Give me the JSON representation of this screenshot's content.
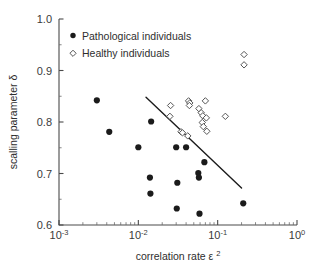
{
  "chart_data": {
    "type": "scatter",
    "title": "",
    "xlabel": "correlation rate ε²",
    "ylabel": "scalling parameter δ",
    "xscale": "log",
    "yscale": "linear",
    "xlim": [
      0.001,
      1.0
    ],
    "ylim": [
      0.6,
      1.0
    ],
    "grid": false,
    "legend_position": "top-left-inside",
    "x_tick_labels": [
      "10⁻³",
      "10⁻²",
      "10⁻¹",
      "10⁰"
    ],
    "x_tick_values": [
      0.001,
      0.01,
      0.1,
      1.0
    ],
    "x_tick_mantissa": [
      "10",
      "10",
      "10",
      "10"
    ],
    "x_tick_exponent": [
      "-3",
      "-2",
      "-1",
      "0"
    ],
    "y_tick_labels": [
      "1.0",
      "0.9",
      "0.8",
      "0.7",
      "0.6"
    ],
    "y_tick_values": [
      1.0,
      0.9,
      0.8,
      0.7,
      0.6
    ],
    "series": [
      {
        "name": "Pathological individuals",
        "marker": "filled-circle",
        "color": "#1b1b1b",
        "points": [
          {
            "x": 0.003,
            "y": 0.842
          },
          {
            "x": 0.0043,
            "y": 0.781
          },
          {
            "x": 0.01,
            "y": 0.751
          },
          {
            "x": 0.0145,
            "y": 0.801
          },
          {
            "x": 0.014,
            "y": 0.692
          },
          {
            "x": 0.0142,
            "y": 0.661
          },
          {
            "x": 0.03,
            "y": 0.751
          },
          {
            "x": 0.031,
            "y": 0.682
          },
          {
            "x": 0.0305,
            "y": 0.632
          },
          {
            "x": 0.04,
            "y": 0.751
          },
          {
            "x": 0.057,
            "y": 0.701
          },
          {
            "x": 0.058,
            "y": 0.692
          },
          {
            "x": 0.059,
            "y": 0.622
          },
          {
            "x": 0.068,
            "y": 0.722
          },
          {
            "x": 0.21,
            "y": 0.642
          }
        ]
      },
      {
        "name": "Healthy individuals",
        "marker": "open-diamond",
        "color": "#555555",
        "points": [
          {
            "x": 0.0255,
            "y": 0.832
          },
          {
            "x": 0.025,
            "y": 0.811
          },
          {
            "x": 0.0345,
            "y": 0.781
          },
          {
            "x": 0.036,
            "y": 0.779
          },
          {
            "x": 0.042,
            "y": 0.773
          },
          {
            "x": 0.043,
            "y": 0.841
          },
          {
            "x": 0.0445,
            "y": 0.837
          },
          {
            "x": 0.044,
            "y": 0.832
          },
          {
            "x": 0.058,
            "y": 0.826
          },
          {
            "x": 0.062,
            "y": 0.818
          },
          {
            "x": 0.065,
            "y": 0.812
          },
          {
            "x": 0.064,
            "y": 0.799
          },
          {
            "x": 0.066,
            "y": 0.791
          },
          {
            "x": 0.07,
            "y": 0.841
          },
          {
            "x": 0.072,
            "y": 0.808
          },
          {
            "x": 0.073,
            "y": 0.782
          },
          {
            "x": 0.125,
            "y": 0.811
          },
          {
            "x": 0.215,
            "y": 0.931
          },
          {
            "x": 0.215,
            "y": 0.911
          }
        ]
      }
    ],
    "fit_line": {
      "name": "regression-trend-line",
      "x_start": 0.0125,
      "y_start": 0.848,
      "x_end": 0.2,
      "y_end": 0.672
    }
  },
  "legend": {
    "entries": [
      {
        "label": "Pathological individuals",
        "marker": "filled-circle"
      },
      {
        "label": "Healthy individuals",
        "marker": "open-diamond"
      }
    ]
  }
}
